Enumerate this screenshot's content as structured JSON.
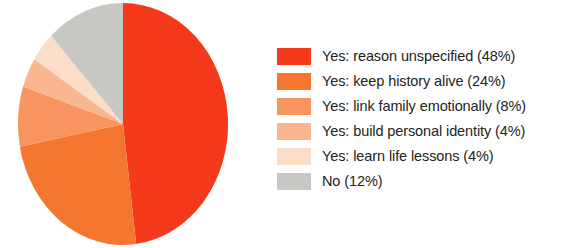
{
  "chart_data": {
    "type": "pie",
    "title": "",
    "subtitle": "",
    "xlabel": "",
    "ylabel": "",
    "grid": false,
    "legend_position": "right",
    "start_angle_deg": 0,
    "direction": "clockwise",
    "categories": [
      "Yes: reason unspecified",
      "Yes: keep history alive",
      "Yes: link family emotionally",
      "Yes: build personal identity",
      "Yes: learn life lessons",
      "No"
    ],
    "values": [
      48,
      24,
      8,
      4,
      4,
      12
    ],
    "value_unit": "%",
    "colors": [
      "#F43A1A",
      "#F4762F",
      "#F7945F",
      "#F9B68F",
      "#FCDDC8",
      "#C7C7C4"
    ],
    "labels": [
      "Yes: reason unspecified (48%)",
      "Yes: keep history alive (24%)",
      "Yes: link family emotionally (8%)",
      "Yes: build personal identity (4%)",
      "Yes: learn life lessons (4%)",
      "No (12%)"
    ]
  },
  "legend": {
    "items": [
      {
        "label": "Yes: reason unspecified (48%)",
        "color": "#F43A1A"
      },
      {
        "label": "Yes: keep history alive (24%)",
        "color": "#F4762F"
      },
      {
        "label": "Yes: link family emotionally (8%)",
        "color": "#F7945F"
      },
      {
        "label": "Yes: build personal identity (4%)",
        "color": "#F9B68F"
      },
      {
        "label": "Yes: learn life lessons (4%)",
        "color": "#FCDDC8"
      },
      {
        "label": "No (12%)",
        "color": "#C7C7C4"
      }
    ]
  }
}
